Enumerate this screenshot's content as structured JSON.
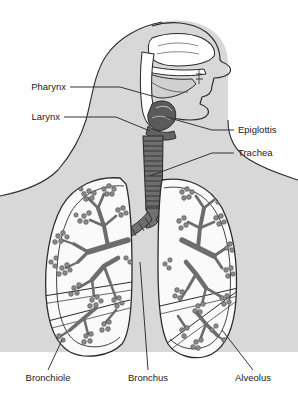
{
  "diagram": {
    "background_color": "#ffffff",
    "body_silhouette_color": "#d8d8d8",
    "outline_color": "#2b2b2b",
    "airway_fill_color": "#ffffff",
    "epiglottis_color": "#5a5a5a",
    "trachea_color": "#6e6e6e",
    "bronchus_color": "#707070",
    "alveoli_color": "#8a8a8a",
    "lung_fill_color": "#fafafa",
    "label_color": "#1a1a1a",
    "leader_color": "#2b2b2b"
  },
  "labels": {
    "pharynx": "Pharynx",
    "larynx": "Larynx",
    "epiglottis": "Epiglottis",
    "trachea": "Trachea",
    "bronchiole": "Bronchiole",
    "bronchus": "Bronchus",
    "alveolus": "Alveolus"
  },
  "label_positions": {
    "pharynx": {
      "x": 66,
      "y": 90,
      "align": "end",
      "leader": "70,87 L 120,87 L 152,96"
    },
    "larynx": {
      "x": 60,
      "y": 120,
      "align": "end",
      "leader": "64,117 L 116,117 L 150,131"
    },
    "epiglottis": {
      "x": 238,
      "y": 133,
      "align": "start",
      "leader": "234,130 L 212,130 L 166,117"
    },
    "trachea": {
      "x": 238,
      "y": 156,
      "align": "start",
      "leader": "234,153 L 212,153 L 150,176"
    },
    "bronchiole": {
      "x": 48,
      "y": 381,
      "align": "middle",
      "leader": "48,372 L 62,340"
    },
    "bronchus": {
      "x": 148,
      "y": 381,
      "align": "middle",
      "leader": "148,372 L 140,260"
    },
    "alveolus": {
      "x": 253,
      "y": 381,
      "align": "middle",
      "leader": "253,372 L 222,330"
    }
  },
  "structures": [
    {
      "name": "nasal-cavity",
      "label_key": "pharynx"
    },
    {
      "name": "oral-cavity",
      "label_key": "pharynx"
    },
    {
      "name": "pharynx",
      "label_key": "pharynx"
    },
    {
      "name": "larynx",
      "label_key": "larynx"
    },
    {
      "name": "epiglottis",
      "label_key": "epiglottis"
    },
    {
      "name": "trachea",
      "label_key": "trachea"
    },
    {
      "name": "left-lung",
      "label_key": "bronchiole"
    },
    {
      "name": "right-lung",
      "label_key": "alveolus"
    },
    {
      "name": "primary-bronchus",
      "label_key": "bronchus"
    },
    {
      "name": "alveolar-sac",
      "label_key": "alveolus"
    }
  ],
  "trachea_rings": 14,
  "alveoli_cluster_count": 34
}
